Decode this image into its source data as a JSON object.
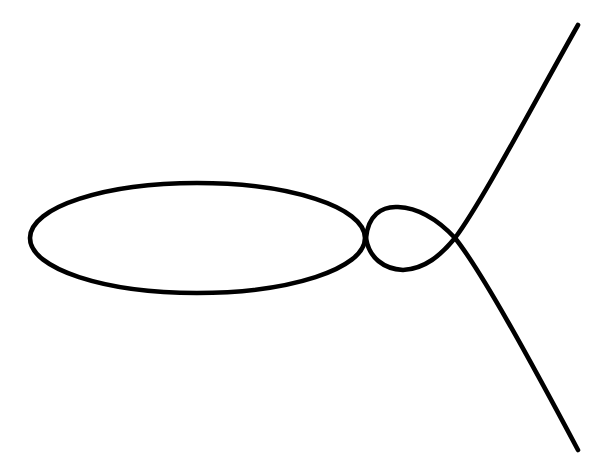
{
  "figure": {
    "title": "Plane curve figure",
    "canvas": {
      "width": 609,
      "height": 468,
      "background_color": "#ffffff"
    },
    "style": {
      "stroke_color": "#000000",
      "stroke_width": 4.6,
      "fill": "none",
      "line_cap": "round",
      "line_join": "round"
    }
  },
  "chart_data": {
    "type": "line",
    "title": "",
    "subtitle": "",
    "xlabel": "",
    "ylabel": "",
    "grid": false,
    "legend": null,
    "axes_visible": false,
    "tick_labels": [],
    "annotations": [],
    "xlim": [
      0,
      609
    ],
    "ylim": [
      0,
      468
    ],
    "coordinate_system": "pixel (origin top-left, y increases downward)",
    "curve_family": "nodal cubic with separate oval component",
    "key_points": {
      "oval_left_tip": [
        30,
        238
      ],
      "oval_top": [
        197,
        183
      ],
      "oval_bottom": [
        197,
        293
      ],
      "oval_right_tip": [
        365,
        238
      ],
      "oval_center": [
        197,
        238
      ],
      "oval_semi_axis_x": 167,
      "oval_semi_axis_y": 55,
      "loop_left_tip": [
        366,
        238
      ],
      "loop_top": [
        396,
        207
      ],
      "loop_bottom": [
        401,
        270
      ],
      "node_crossing": [
        455,
        238
      ],
      "upper_branch_end": [
        578,
        25
      ],
      "lower_branch_end": [
        578,
        450
      ]
    },
    "series": [
      {
        "name": "oval-component",
        "kind": "closed-ellipse",
        "path": "M 30 238 C 30 207 105 183 197 183 C 289 183 365 207 365 238 C 365 269 289 293 197 293 C 105 293 30 269 30 238 Z",
        "points": [
          [
            30,
            238
          ],
          [
            60,
            206
          ],
          [
            120,
            189
          ],
          [
            197,
            183
          ],
          [
            275,
            187
          ],
          [
            330,
            203
          ],
          [
            365,
            238
          ],
          [
            332,
            271
          ],
          [
            275,
            287
          ],
          [
            197,
            293
          ],
          [
            120,
            288
          ],
          [
            60,
            270
          ],
          [
            30,
            238
          ]
        ]
      },
      {
        "name": "loop-and-upper-branch",
        "kind": "open-arc",
        "path": "M 366 238 C 368 216 381 206 398 207 C 421 208 440 222 455 238 C 483 200 530 110 578 25",
        "points": [
          [
            366,
            238
          ],
          [
            372,
            218
          ],
          [
            385,
            208
          ],
          [
            398,
            207
          ],
          [
            418,
            210
          ],
          [
            438,
            222
          ],
          [
            455,
            238
          ],
          [
            478,
            205
          ],
          [
            505,
            160
          ],
          [
            534,
            110
          ],
          [
            560,
            62
          ],
          [
            578,
            25
          ]
        ]
      },
      {
        "name": "loop-and-lower-branch",
        "kind": "open-arc",
        "path": "M 366 238 C 369 258 384 269 403 270 C 425 269 441 255 455 238 C 482 272 530 360 578 450",
        "points": [
          [
            366,
            238
          ],
          [
            373,
            259
          ],
          [
            388,
            269
          ],
          [
            403,
            270
          ],
          [
            425,
            266
          ],
          [
            442,
            253
          ],
          [
            455,
            238
          ],
          [
            479,
            272
          ],
          [
            506,
            320
          ],
          [
            535,
            375
          ],
          [
            561,
            420
          ],
          [
            578,
            450
          ]
        ]
      }
    ]
  }
}
